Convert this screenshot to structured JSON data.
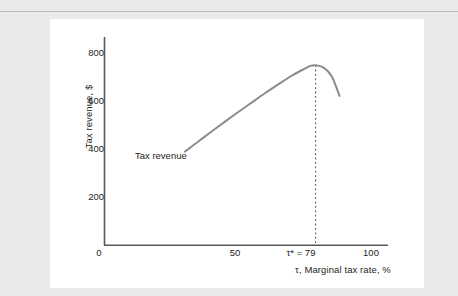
{
  "figure": {
    "background_color": "#e9eaea",
    "card_color": "#ffffff",
    "rule_color": "#b9bbbb"
  },
  "chart_data": {
    "type": "line",
    "title": "",
    "subtitle": "",
    "xlabel": "τ, Marginal tax rate, %",
    "ylabel": "Tax revenue, $",
    "xlim": [
      0,
      110
    ],
    "ylim": [
      0,
      880
    ],
    "grid": false,
    "legend_position": "in-plot annotation",
    "axis_color": "#58595b",
    "series": [
      {
        "name": "Tax revenue",
        "color": "#8c8c8c",
        "x": [
          30,
          35,
          40,
          45,
          50,
          55,
          60,
          65,
          70,
          74,
          77,
          79,
          82,
          85,
          88
        ],
        "values": [
          390,
          432,
          474,
          515,
          555,
          594,
          633,
          670,
          706,
          730,
          747,
          750,
          740,
          705,
          622
        ]
      }
    ],
    "xticks": [
      {
        "value": 0,
        "label": "0"
      },
      {
        "value": 50,
        "label": "50"
      },
      {
        "value": 79,
        "label": "τ* = 79"
      },
      {
        "value": 100,
        "label": "100"
      }
    ],
    "yticks": [
      {
        "value": 200,
        "label": "200"
      },
      {
        "value": 400,
        "label": "400"
      },
      {
        "value": 600,
        "label": "600"
      },
      {
        "value": 800,
        "label": "800"
      }
    ],
    "annotations": [
      {
        "name": "series-label",
        "text": "Tax revenue",
        "x": 33,
        "y": 330
      }
    ],
    "reference_lines": [
      {
        "name": "optimal-tax-rate-line",
        "orientation": "vertical",
        "x": 79,
        "label": "τ* = 79",
        "style": "dotted",
        "color": "#58595b",
        "y_from": 0,
        "y_to": 750
      }
    ],
    "peak": {
      "x": 79,
      "y": 750,
      "label": "τ* = 79"
    }
  }
}
